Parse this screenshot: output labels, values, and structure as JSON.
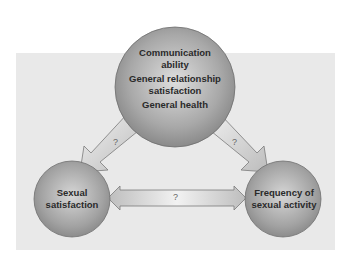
{
  "diagram": {
    "top_node": {
      "lines": [
        "Communication ability",
        "General relationship satisfaction",
        "General health"
      ],
      "line_parts": [
        [
          "Communication",
          "ability"
        ],
        [
          "General relationship",
          "satisfaction"
        ],
        [
          "General health"
        ]
      ]
    },
    "left_node": {
      "lines": [
        "Sexual",
        "satisfaction"
      ]
    },
    "right_node": {
      "lines": [
        "Frequency of",
        "sexual activity"
      ]
    },
    "arrows": [
      {
        "from": "top_node",
        "to": "left_node",
        "label": "?"
      },
      {
        "from": "top_node",
        "to": "right_node",
        "label": "?"
      },
      {
        "from": "left_node",
        "to": "right_node",
        "label": "?",
        "bidirectional": true
      }
    ],
    "colors": {
      "panel": "#e9e9e9",
      "circle_light": "#d8d8d8",
      "circle_dark": "#8a8a8a",
      "arrow_fill": "#cfcfcf",
      "arrow_stroke": "#7a7a7a"
    }
  }
}
